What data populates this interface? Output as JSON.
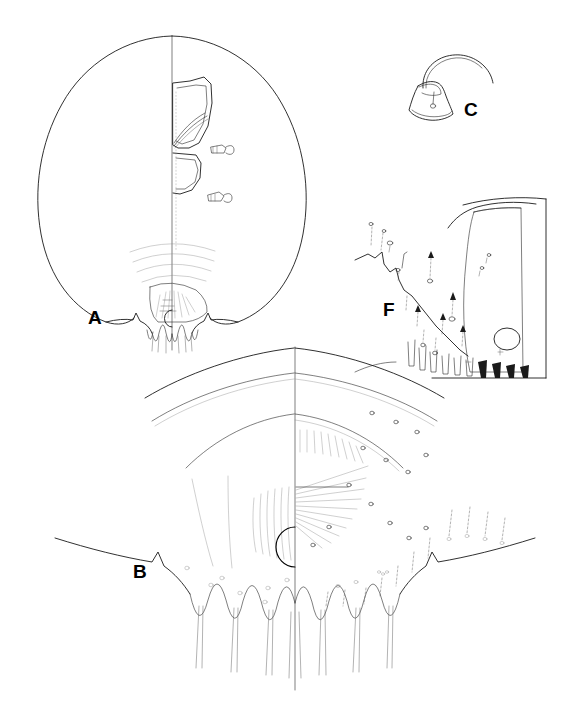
{
  "figure": {
    "type": "scientific-line-drawing-plate",
    "background_color": "#ffffff",
    "ink_color": "#1a1a1a",
    "width": 585,
    "height": 715,
    "panel_count": 4
  },
  "panels": [
    {
      "id": "A",
      "label": "A",
      "name": "whole-body-outline",
      "description": "Bilaterally symmetric broadly oval body outline with vertical midline; right half shows internal structures; posterior margin bears scalloped lobes and concentric arcs",
      "label_position": {
        "x": 88,
        "y": 308
      },
      "features": [
        "body-outline-oval",
        "midline-axis",
        "anterior-clypeal-plate",
        "mouthpart-structure",
        "spiracle-upper",
        "spiracle-lower",
        "concentric-arcs-posterior",
        "pygidial-lobes",
        "anal-opening"
      ]
    },
    {
      "id": "B",
      "label": "B",
      "name": "pygidium-detail",
      "description": "Magnified posterior pygidium, bilaterally split at midline; concentric marginal bands, radiating striations, semicircular anal opening, scalloped lobes with deep clefts, pores and setae",
      "label_position": {
        "x": 133,
        "y": 562
      },
      "features": [
        "midline-axis",
        "marginal-band-outer",
        "marginal-band-middle",
        "marginal-band-inner",
        "radiating-striations",
        "anal-opening-semicircle",
        "pygidial-lobes-scalloped",
        "lateral-margin-left",
        "lateral-margin-right",
        "disc-pores",
        "marginal-setae"
      ]
    },
    {
      "id": "C",
      "label": "C",
      "name": "antenna-detail",
      "description": "Trapezoidal antennal tubercle with a single long curved apical seta and a small internal pore",
      "label_position": {
        "x": 464,
        "y": 100
      },
      "features": [
        "antennal-tubercle",
        "apical-curved-seta",
        "internal-pore"
      ]
    },
    {
      "id": "F",
      "label": "F",
      "name": "margin-detail",
      "description": "Enlarged marginal detail showing setae, duct openings, pores and a densely striated sclerotised area containing a large circular pore",
      "label_position": {
        "x": 383,
        "y": 300
      },
      "features": [
        "margin-contour",
        "setae-row",
        "duct-openings",
        "striated-area",
        "large-circular-pore",
        "marginal-lobes",
        "panel-border-line"
      ]
    }
  ]
}
